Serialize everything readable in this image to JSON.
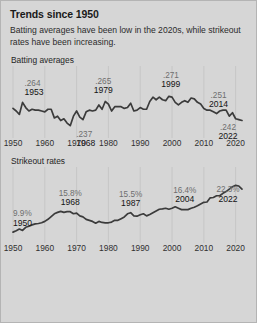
{
  "header": {
    "title": "Trends since 1950",
    "subtitle": "Batting averages have been low in the 2020s, while strikeout rates have been increasing."
  },
  "panels": {
    "batting": {
      "title": "Batting averages"
    },
    "strikeout": {
      "title": "Strikeout rates"
    }
  },
  "colors": {
    "background": "#d6d6d6",
    "border": "#b4b4b4",
    "line": "#3b3b3b",
    "gridline": "#c6c6c6",
    "value_label": "#6e6e6e",
    "year_label": "#141414",
    "axis_label": "#303030"
  },
  "chart_data": [
    {
      "type": "line",
      "title": "Batting averages",
      "xlabel": "",
      "ylabel": "",
      "xlim": [
        1950,
        2022
      ],
      "ylim": [
        0.232,
        0.276
      ],
      "grid": "vertical",
      "legend": "none",
      "tick_labels": [
        "1950",
        "1960",
        "1970",
        "1980",
        "1990",
        "2000",
        "2010",
        "2020"
      ],
      "ticks": [
        1950,
        1960,
        1970,
        1980,
        1990,
        2000,
        2010,
        2020
      ],
      "annotations": [
        {
          "value": ".264",
          "year": "1953",
          "x": 1953,
          "y": 0.264
        },
        {
          "value": ".237",
          "year": "1968",
          "x": 1968,
          "y": 0.237
        },
        {
          "value": ".265",
          "year": "1979",
          "x": 1979,
          "y": 0.265
        },
        {
          "value": ".271",
          "year": "1999",
          "x": 1999,
          "y": 0.271
        },
        {
          "value": ".251",
          "year": "2014",
          "x": 2014,
          "y": 0.251
        },
        {
          "value": ".242",
          "year": "2022",
          "x": 2022,
          "y": 0.243
        }
      ],
      "x": [
        1950,
        1951,
        1952,
        1953,
        1954,
        1955,
        1956,
        1957,
        1958,
        1959,
        1960,
        1961,
        1962,
        1963,
        1964,
        1965,
        1966,
        1967,
        1968,
        1969,
        1970,
        1971,
        1972,
        1973,
        1974,
        1975,
        1976,
        1977,
        1978,
        1979,
        1980,
        1981,
        1982,
        1983,
        1984,
        1985,
        1986,
        1987,
        1988,
        1989,
        1990,
        1991,
        1992,
        1993,
        1994,
        1995,
        1996,
        1997,
        1998,
        1999,
        2000,
        2001,
        2002,
        2003,
        2004,
        2005,
        2006,
        2007,
        2008,
        2009,
        2010,
        2011,
        2012,
        2013,
        2014,
        2015,
        2016,
        2017,
        2018,
        2019,
        2020,
        2021,
        2022
      ],
      "values": [
        0.257,
        0.254,
        0.25,
        0.264,
        0.258,
        0.254,
        0.256,
        0.255,
        0.255,
        0.254,
        0.253,
        0.256,
        0.256,
        0.246,
        0.248,
        0.243,
        0.245,
        0.24,
        0.237,
        0.248,
        0.254,
        0.247,
        0.244,
        0.253,
        0.255,
        0.254,
        0.255,
        0.261,
        0.256,
        0.265,
        0.262,
        0.254,
        0.259,
        0.259,
        0.259,
        0.257,
        0.258,
        0.263,
        0.254,
        0.255,
        0.258,
        0.256,
        0.256,
        0.265,
        0.27,
        0.267,
        0.27,
        0.267,
        0.266,
        0.271,
        0.27,
        0.264,
        0.261,
        0.264,
        0.266,
        0.264,
        0.269,
        0.268,
        0.264,
        0.262,
        0.257,
        0.255,
        0.255,
        0.253,
        0.251,
        0.254,
        0.255,
        0.255,
        0.248,
        0.252,
        0.245,
        0.244,
        0.243
      ]
    },
    {
      "type": "line",
      "title": "Strikeout rates",
      "xlabel": "",
      "ylabel": "",
      "xlim": [
        1950,
        2022
      ],
      "ylim": [
        8.5,
        23.5
      ],
      "grid": "vertical",
      "legend": "none",
      "tick_labels": [
        "1950",
        "1960",
        "1970",
        "1980",
        "1990",
        "2000",
        "2010",
        "2020"
      ],
      "ticks": [
        1950,
        1960,
        1970,
        1980,
        1990,
        2000,
        2010,
        2020
      ],
      "annotations": [
        {
          "value": "9.9%",
          "year": "1950",
          "x": 1950,
          "y": 9.9
        },
        {
          "value": "15.8%",
          "year": "1968",
          "x": 1968,
          "y": 15.8
        },
        {
          "value": "15.5%",
          "year": "1987",
          "x": 1987,
          "y": 15.5
        },
        {
          "value": "16.4%",
          "year": "2004",
          "x": 2004,
          "y": 16.4
        },
        {
          "value": "22.3%",
          "year": "2022",
          "x": 2022,
          "y": 22.3
        }
      ],
      "x": [
        1950,
        1951,
        1952,
        1953,
        1954,
        1955,
        1956,
        1957,
        1958,
        1959,
        1960,
        1961,
        1962,
        1963,
        1964,
        1965,
        1966,
        1967,
        1968,
        1969,
        1970,
        1971,
        1972,
        1973,
        1974,
        1975,
        1976,
        1977,
        1978,
        1979,
        1980,
        1981,
        1982,
        1983,
        1984,
        1985,
        1986,
        1987,
        1988,
        1989,
        1990,
        1991,
        1992,
        1993,
        1994,
        1995,
        1996,
        1997,
        1998,
        1999,
        2000,
        2001,
        2002,
        2003,
        2004,
        2005,
        2006,
        2007,
        2008,
        2009,
        2010,
        2011,
        2012,
        2013,
        2014,
        2015,
        2016,
        2017,
        2018,
        2019,
        2020,
        2021,
        2022
      ],
      "values": [
        9.9,
        10.3,
        10.8,
        10.4,
        11.3,
        11.6,
        12.0,
        12.3,
        12.4,
        12.6,
        13.0,
        13.6,
        14.4,
        15.2,
        15.6,
        15.9,
        15.6,
        15.8,
        15.8,
        15.2,
        15.4,
        14.6,
        14.3,
        13.6,
        13.3,
        13.0,
        12.5,
        13.0,
        12.7,
        12.6,
        12.6,
        12.8,
        13.3,
        13.3,
        13.8,
        14.3,
        15.2,
        15.5,
        14.6,
        14.5,
        14.9,
        15.2,
        14.6,
        15.0,
        15.5,
        16.0,
        16.5,
        16.6,
        16.8,
        16.5,
        16.8,
        17.2,
        16.8,
        16.4,
        16.4,
        16.4,
        16.8,
        17.1,
        17.5,
        18.0,
        18.5,
        18.6,
        19.8,
        19.9,
        20.4,
        20.4,
        21.1,
        21.6,
        22.3,
        23.0,
        23.4,
        23.2,
        22.3
      ]
    }
  ]
}
